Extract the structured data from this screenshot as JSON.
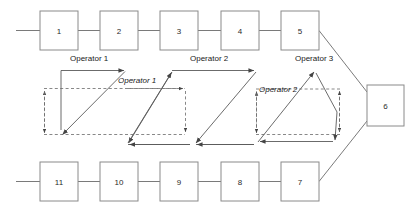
{
  "diagram": {
    "colors": {
      "stroke": "#555555",
      "box_stroke": "#777777",
      "text": "#2b2b2b",
      "background": "#ffffff"
    },
    "top_row": {
      "stations": [
        {
          "id": "station-1",
          "label": "1",
          "x": 40,
          "y": 11
        },
        {
          "id": "station-2",
          "label": "2",
          "x": 100,
          "y": 11
        },
        {
          "id": "station-3",
          "label": "3",
          "x": 160,
          "y": 11
        },
        {
          "id": "station-4",
          "label": "4",
          "x": 221,
          "y": 11
        },
        {
          "id": "station-5",
          "label": "5",
          "x": 281,
          "y": 11
        }
      ]
    },
    "bottom_row": {
      "stations": [
        {
          "id": "station-11",
          "label": "11",
          "x": 40,
          "y": 162
        },
        {
          "id": "station-10",
          "label": "10",
          "x": 100,
          "y": 162
        },
        {
          "id": "station-9",
          "label": "9",
          "x": 160,
          "y": 162
        },
        {
          "id": "station-8",
          "label": "8",
          "x": 221,
          "y": 162
        },
        {
          "id": "station-7",
          "label": "7",
          "x": 281,
          "y": 162
        }
      ]
    },
    "end_station": {
      "id": "station-6",
      "label": "6",
      "x": 367,
      "y": 85
    },
    "operator_labels": {
      "op1_upright": "Operator 1",
      "op1_italic": "Operator 1",
      "op2_upright": "Operator 2",
      "op2_italic": "Operator 2",
      "op3_upright": "Operator 3"
    },
    "box_size": {
      "width": 38,
      "height": 39
    },
    "end_box_size": {
      "width": 37,
      "height": 41
    }
  }
}
